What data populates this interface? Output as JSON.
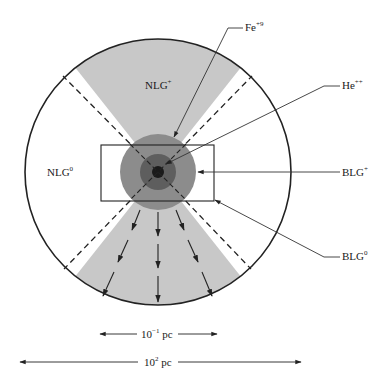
{
  "diagram": {
    "type": "AGN unified model schematic",
    "labels": {
      "nlg_plus": {
        "base": "NLG",
        "sup": "+"
      },
      "nlg_zero": {
        "base": "NLG",
        "sup": "0"
      },
      "fe": {
        "base": "Fe",
        "sup": "+9"
      },
      "he": {
        "base": "He",
        "sup": "++"
      },
      "blg_plus": {
        "base": "BLG",
        "sup": "+"
      },
      "blg_zero": {
        "base": "BLG",
        "sup": "0"
      }
    },
    "scales": {
      "inner": {
        "base": "10",
        "sup": "−1",
        "unit": " pc"
      },
      "outer": {
        "base": "10",
        "sup": "2",
        "unit": " pc"
      }
    },
    "colors": {
      "cone": "#c8c8c8",
      "blr_outer": "#8c8c8c",
      "blr_inner": "#5e5e5e",
      "core": "#1a1a1a",
      "line": "#222222"
    }
  }
}
